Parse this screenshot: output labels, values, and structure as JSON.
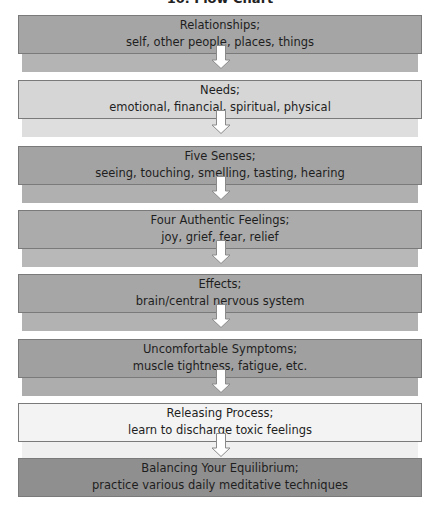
{
  "title": "10. Flow Chart",
  "colors": {
    "dark": "#a3a3a3",
    "dark_strip": "#b5b5b5",
    "light": "#d9d9d9",
    "light_strip": "#e2e2e2",
    "white": "#f4f4f4",
    "white_strip": "#f7f7f7",
    "final": "#8f8f8f",
    "arrow_fill": "#ffffff",
    "arrow_stroke": "#8a8a8a",
    "border": "#7a7a7a"
  },
  "steps": [
    {
      "heading": "Relationships;",
      "detail": "self, other people, places, things",
      "top": 15,
      "fill": "#a5a5a5",
      "strip": "#b4b4b4",
      "has_arrow": true
    },
    {
      "heading": "Needs;",
      "detail": "emotional, financial, spiritual, physical",
      "top": 80,
      "fill": "#d6d6d6",
      "strip": "#dedede",
      "has_arrow": true
    },
    {
      "heading": "Five Senses;",
      "detail": "seeing, touching, smelling, tasting, hearing",
      "top": 146,
      "fill": "#a3a3a3",
      "strip": "#b0b0b0",
      "has_arrow": true
    },
    {
      "heading": "Four Authentic Feelings;",
      "detail": "joy, grief, fear, relief",
      "top": 210,
      "fill": "#ababab",
      "strip": "#b8b8b8",
      "has_arrow": true
    },
    {
      "heading": "Effects;",
      "detail": "brain/central nervous system",
      "top": 274,
      "fill": "#a6a6a6",
      "strip": "#b2b2b2",
      "has_arrow": true
    },
    {
      "heading": "Uncomfortable Symptoms;",
      "detail": "muscle tightness, fatigue, etc.",
      "top": 339,
      "fill": "#a0a0a0",
      "strip": "#adadad",
      "has_arrow": true
    },
    {
      "heading": "Releasing Process;",
      "detail": "learn to discharge toxic feelings",
      "top": 403,
      "fill": "#f3f3f3",
      "strip": "#f0f0f0",
      "has_arrow": true
    },
    {
      "heading": "Balancing Your Equilibrium;",
      "detail": "practice various daily meditative techniques",
      "top": 458,
      "fill": "#8f8f8f",
      "strip": null,
      "has_arrow": false
    }
  ]
}
